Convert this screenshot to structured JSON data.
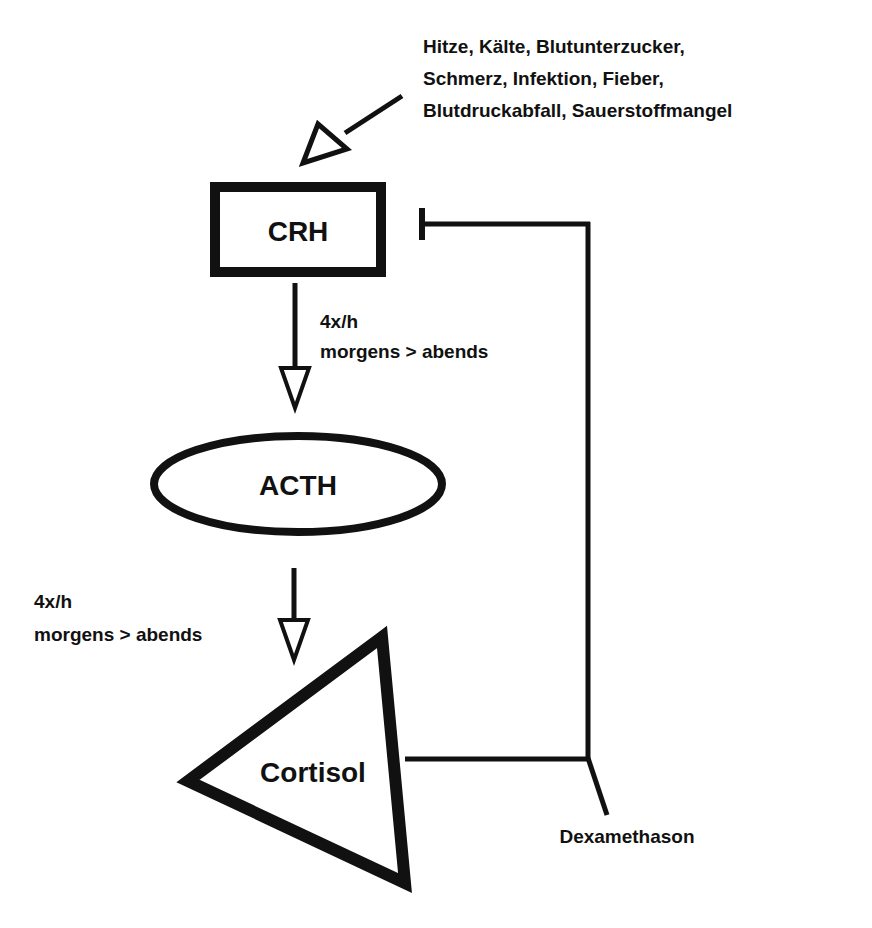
{
  "diagram": {
    "colors": {
      "stroke": "#111111",
      "background": "#ffffff"
    },
    "stimuli": {
      "lines": [
        "Hitze, Kälte, Blutunterzucker,",
        "Schmerz, Infektion, Fieber,",
        "Blutdruckabfall, Sauerstoffmangel"
      ]
    },
    "nodes": {
      "crh": {
        "label": "CRH",
        "shape": "rectangle"
      },
      "acth": {
        "label": "ACTH",
        "shape": "ellipse"
      },
      "cortisol": {
        "label": "Cortisol",
        "shape": "triangle"
      }
    },
    "edges": {
      "crh_to_acth": {
        "line1": "4x/h",
        "line2": "morgens > abends",
        "type": "stimulation"
      },
      "acth_to_cortisol": {
        "line1": "4x/h",
        "line2": "morgens > abends",
        "type": "stimulation"
      },
      "cortisol_feedback": {
        "type": "inhibition",
        "target": "CRH"
      }
    },
    "inhibitor": {
      "label": "Dexamethason"
    }
  }
}
